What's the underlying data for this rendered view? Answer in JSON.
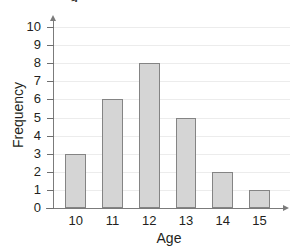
{
  "title_fragment": "g",
  "chart_data": {
    "type": "bar",
    "title": "",
    "xlabel": "Age",
    "ylabel": "Frequency",
    "categories": [
      "10",
      "11",
      "12",
      "13",
      "14",
      "15"
    ],
    "values": [
      3,
      6,
      8,
      5,
      2,
      1
    ],
    "ylim": [
      0,
      10
    ],
    "ytick_labels": [
      "0",
      "1",
      "2",
      "3",
      "4",
      "5",
      "6",
      "7",
      "8",
      "9",
      "10"
    ],
    "ytick_values": [
      0,
      1,
      2,
      3,
      4,
      5,
      6,
      7,
      8,
      9,
      10
    ],
    "grid": true,
    "legend": false,
    "bar_fill_color": "#d5d5d5",
    "bar_border_color": "#848484",
    "axis_color": "#7b7b7b",
    "gridline_color": "#ececec",
    "background_color": "#ffffff"
  }
}
